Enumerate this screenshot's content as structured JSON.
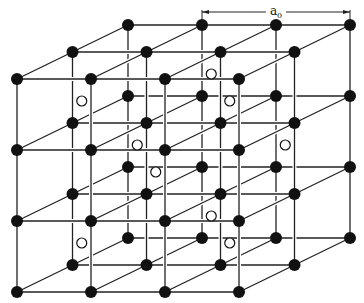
{
  "lattice": {
    "nodes_x": 4,
    "nodes_y": 4,
    "nodes_z": 3,
    "atom_color": "#111111",
    "line_color": "#222222",
    "interstitial_color": "#111111"
  },
  "interstitials": [
    [
      0.5,
      0.5,
      0.5
    ],
    [
      1.5,
      0.5,
      1.5
    ],
    [
      2.5,
      0.5,
      0.5
    ],
    [
      0.5,
      1.5,
      1.5
    ],
    [
      2.5,
      1.5,
      1.5
    ],
    [
      1.5,
      1.5,
      0.5
    ],
    [
      0.5,
      2.5,
      0.5
    ],
    [
      1.5,
      2.5,
      1.5
    ],
    [
      2.5,
      2.5,
      0.5
    ]
  ],
  "dimension": {
    "label": "a",
    "subscript": "0",
    "span_cells": 2
  }
}
